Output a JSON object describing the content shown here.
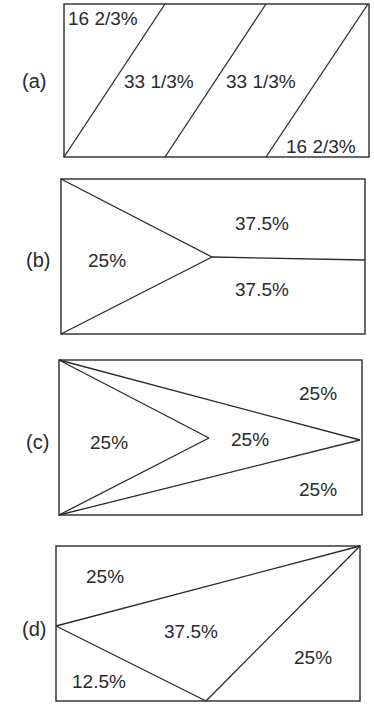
{
  "panels": {
    "a": {
      "label": "(a)",
      "regions": [
        "16 2/3%",
        "33 1/3%",
        "33 1/3%",
        "16 2/3%"
      ]
    },
    "b": {
      "label": "(b)",
      "regions": [
        "25%",
        "37.5%",
        "37.5%"
      ]
    },
    "c": {
      "label": "(c)",
      "regions": [
        "25%",
        "25%",
        "25%",
        "25%"
      ]
    },
    "d": {
      "label": "(d)",
      "regions": [
        "25%",
        "37.5%",
        "12.5%",
        "25%"
      ]
    }
  }
}
